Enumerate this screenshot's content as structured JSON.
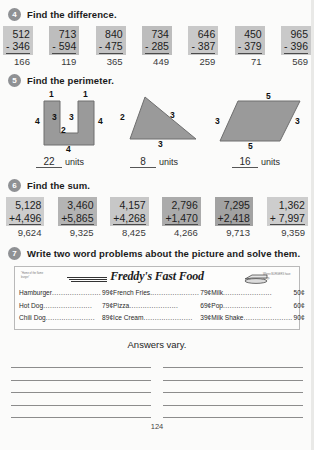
{
  "page": {
    "number": "124"
  },
  "exercise4": {
    "badge": "4",
    "title": "Find the difference.",
    "problems": [
      {
        "top": "512",
        "bottom": "- 346",
        "answer": "166",
        "shade": "#c9c9c9"
      },
      {
        "top": "713",
        "bottom": "- 594",
        "answer": "119",
        "shade": "#bdbdbd"
      },
      {
        "top": "840",
        "bottom": "- 475",
        "answer": "365",
        "shade": "#c4c4c4"
      },
      {
        "top": "734",
        "bottom": "- 285",
        "answer": "449",
        "shade": "#bdbdbd"
      },
      {
        "top": "646",
        "bottom": "- 387",
        "answer": "259",
        "shade": "#c9c9c9"
      },
      {
        "top": "450",
        "bottom": "- 379",
        "answer": "71",
        "shade": "#c4c4c4"
      },
      {
        "top": "965",
        "bottom": "- 396",
        "answer": "569",
        "shade": "#c9c9c9"
      }
    ]
  },
  "exercise5": {
    "badge": "5",
    "title": "Find the perimeter.",
    "unit_label": "units",
    "shapes": [
      {
        "name": "u-shape",
        "answer": "22",
        "labels": [
          "1",
          "1",
          "4",
          "4",
          "3",
          "3",
          "2",
          "4"
        ]
      },
      {
        "name": "triangle",
        "answer": "8",
        "labels": [
          "2",
          "3",
          "3"
        ]
      },
      {
        "name": "parallelogram",
        "answer": "16",
        "labels": [
          "5",
          "5",
          "3",
          "3"
        ]
      }
    ]
  },
  "exercise6": {
    "badge": "6",
    "title": "Find the sum.",
    "problems": [
      {
        "top": "5,128",
        "bottom": "+4,496",
        "answer": "9,624",
        "shade": "#cdcdcd"
      },
      {
        "top": "3,460",
        "bottom": "+5,865",
        "answer": "9,325",
        "shade": "#b4b4b4"
      },
      {
        "top": "4,157",
        "bottom": "+4,268",
        "answer": "8,425",
        "shade": "#c7c7c7"
      },
      {
        "top": "2,796",
        "bottom": "+1,470",
        "answer": "4,266",
        "shade": "#ababab"
      },
      {
        "top": "7,295",
        "bottom": "+2,418",
        "answer": "9,713",
        "shade": "#a2a2a2"
      },
      {
        "top": "1,362",
        "bottom": "+ 7,997",
        "answer": "9,359",
        "shade": "#cdcdcd"
      }
    ]
  },
  "exercise7": {
    "badge": "7",
    "title": "Write two word problems about the picture and solve them.",
    "answers_vary": "Answers vary.",
    "menu": {
      "brand": "Freddy's Fast Food",
      "micro_left": "\"Home of the flame burger\"",
      "micro_right": "Where BURGERS have wings",
      "columns": [
        [
          {
            "item": "Hamburger",
            "price": "99¢"
          },
          {
            "item": "Hot Dog",
            "price": "79¢"
          },
          {
            "item": "Chili Dog",
            "price": "89¢"
          }
        ],
        [
          {
            "item": "French Fries",
            "price": "79¢"
          },
          {
            "item": "Pizza",
            "price": "69¢"
          },
          {
            "item": "Ice Cream",
            "price": "39¢"
          }
        ],
        [
          {
            "item": "Milk",
            "price": "50¢"
          },
          {
            "item": "Pop",
            "price": "60¢"
          },
          {
            "item": "Milk Shake",
            "price": "90¢"
          }
        ]
      ]
    },
    "line_rows": 5
  }
}
